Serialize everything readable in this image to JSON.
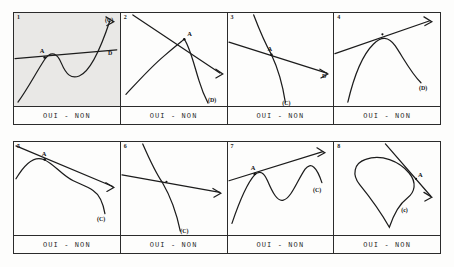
{
  "document": {
    "kind": "exercise-worksheet-figure",
    "answer_prompt": "OUI - NON",
    "grid": {
      "rows": 2,
      "columns": 4
    }
  },
  "panels": [
    {
      "number": "1",
      "shaded": true,
      "point_label": "A",
      "extra_labels": [
        "(C)",
        "D"
      ],
      "answer": "OUI - NON",
      "description": "S-shaped curve crossing a gently rising straight line at point A"
    },
    {
      "number": "2",
      "shaded": false,
      "point_label": "A",
      "extra_labels": [
        "(D)",
        "(C)"
      ],
      "answer": "OUI - NON",
      "description": "Descending straight line meeting a curve that peaks at A then falls steeply"
    },
    {
      "number": "3",
      "shaded": false,
      "point_label": "A",
      "extra_labels": [
        "(C)",
        "(D)"
      ],
      "answer": "OUI - NON",
      "description": "Steeply descending curve crossing a shallow descending line at point A"
    },
    {
      "number": "4",
      "shaded": false,
      "point_label": "A",
      "extra_labels": [
        "(D)",
        "(C)"
      ],
      "answer": "OUI - NON",
      "description": "Rising straight line tangent to an arch-shaped curve near point A"
    },
    {
      "number": "5",
      "shaded": false,
      "point_label": "A",
      "extra_labels": [
        "(C)",
        "(D)"
      ],
      "answer": "OUI - NON",
      "description": "Descending line touching a wavy curve at point A"
    },
    {
      "number": "6",
      "shaded": false,
      "point_label": "A",
      "extra_labels": [
        "(C)",
        "(D)"
      ],
      "answer": "OUI - NON",
      "description": "Hyperbola-like descending curve crossing a shallow line at point A"
    },
    {
      "number": "7",
      "shaded": false,
      "point_label": "A",
      "extra_labels": [
        "(C)",
        "(D)"
      ],
      "answer": "OUI - NON",
      "description": "Rising line above a double-humped curve touching at point A"
    },
    {
      "number": "8",
      "shaded": false,
      "point_label": "A",
      "extra_labels": [
        "(C)",
        "(D)"
      ],
      "answer": "OUI - NON",
      "description": "Closed teardrop-shaped curve crossed by a descending line at point A"
    }
  ],
  "colors": {
    "ink": "#1c1c1c",
    "border": "#2b2b2b",
    "paper": "#fdfdfc",
    "shade": "#e9e8e6"
  }
}
